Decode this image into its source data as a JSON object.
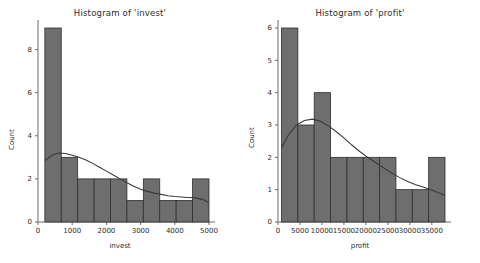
{
  "figure": {
    "background": "#ffffff",
    "bar_color": "#6e6e6e",
    "bar_edge_color": "#2f2f2f",
    "kde_color": "#3a3a3a",
    "axis_color": "#6b6b6b"
  },
  "charts": [
    {
      "id": "invest",
      "title": "Histogram of 'invest'",
      "xlabel": "invest",
      "ylabel": "Count"
    },
    {
      "id": "profit",
      "title": "Histogram of 'profit'",
      "xlabel": "profit",
      "ylabel": "Count"
    }
  ],
  "chart_data": [
    {
      "type": "bar",
      "id": "invest",
      "title": "Histogram of 'invest'",
      "xlabel": "invest",
      "ylabel": "Count",
      "xlim": [
        0,
        5000
      ],
      "ylim": [
        0,
        9
      ],
      "xticks": [
        0,
        1000,
        2000,
        3000,
        4000,
        5000
      ],
      "xticklabels": [
        "0",
        "1000",
        "2000",
        "3000",
        "4000",
        "5000"
      ],
      "yticks": [
        0,
        2,
        4,
        6,
        8
      ],
      "yticklabels": [
        "0",
        "2",
        "4",
        "6",
        "8"
      ],
      "grid": false,
      "legend": "none",
      "bin_edges": [
        200,
        680,
        1160,
        1640,
        2120,
        2600,
        3080,
        3560,
        4040,
        4520,
        5000
      ],
      "categories": [
        "200-680",
        "680-1160",
        "1160-1640",
        "1640-2120",
        "2120-2600",
        "2600-3080",
        "3080-3560",
        "3560-4040",
        "4040-4520",
        "4520-5000"
      ],
      "values": [
        9,
        3,
        2,
        2,
        2,
        1,
        2,
        1,
        1,
        2
      ],
      "overlay": {
        "type": "line",
        "name": "kde",
        "x": [
          200,
          400,
          600,
          800,
          1000,
          1200,
          1400,
          1600,
          1800,
          2000,
          2200,
          2400,
          2600,
          2800,
          3000,
          3200,
          3400,
          3600,
          3800,
          4000,
          4200,
          4400,
          4600,
          4800,
          5000
        ],
        "y": [
          2.85,
          3.08,
          3.2,
          3.18,
          3.1,
          3.0,
          2.88,
          2.72,
          2.54,
          2.36,
          2.18,
          2.0,
          1.82,
          1.66,
          1.52,
          1.42,
          1.34,
          1.28,
          1.22,
          1.18,
          1.16,
          1.14,
          1.12,
          1.05,
          0.9
        ]
      }
    },
    {
      "type": "bar",
      "id": "profit",
      "title": "Histogram of 'profit'",
      "xlabel": "profit",
      "ylabel": "Count",
      "xlim": [
        0,
        38000
      ],
      "ylim": [
        0,
        6
      ],
      "xticks": [
        0,
        5000,
        10000,
        15000,
        20000,
        25000,
        30000,
        35000
      ],
      "xticklabels": [
        "0",
        "5000",
        "10000",
        "15000",
        "20000",
        "25000",
        "30000",
        "35000"
      ],
      "yticks": [
        0,
        1,
        2,
        3,
        4,
        5,
        6
      ],
      "yticklabels": [
        "0",
        "1",
        "2",
        "3",
        "4",
        "5",
        "6"
      ],
      "grid": false,
      "legend": "none",
      "bin_edges": [
        800,
        4520,
        8240,
        11960,
        15680,
        19400,
        23120,
        26840,
        30560,
        34280,
        38000
      ],
      "categories": [
        "800-4520",
        "4520-8240",
        "8240-11960",
        "11960-15680",
        "15680-19400",
        "19400-23120",
        "23120-26840",
        "26840-30560",
        "30560-34280",
        "34280-38000"
      ],
      "values": [
        6,
        3,
        4,
        2,
        2,
        2,
        2,
        1,
        1,
        2
      ],
      "overlay": {
        "type": "line",
        "name": "kde",
        "x": [
          800,
          2500,
          4200,
          6000,
          7800,
          9600,
          11400,
          13200,
          15000,
          16800,
          18600,
          20400,
          22200,
          24000,
          25800,
          27600,
          29400,
          31200,
          33000,
          34800,
          36600,
          38000
        ],
        "y": [
          2.3,
          2.72,
          3.0,
          3.14,
          3.18,
          3.12,
          2.98,
          2.8,
          2.6,
          2.38,
          2.18,
          2.0,
          1.84,
          1.68,
          1.52,
          1.38,
          1.26,
          1.16,
          1.08,
          1.0,
          0.9,
          0.82
        ]
      }
    }
  ]
}
